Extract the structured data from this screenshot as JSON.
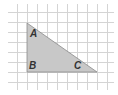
{
  "diagram": {
    "type": "right-triangle-on-grid",
    "grid": {
      "spacing": 10,
      "vertical_lines_x": [
        17,
        27,
        37,
        47,
        57,
        67,
        77,
        87,
        97,
        107
      ],
      "horizontal_lines_y": [
        12,
        22,
        32,
        42,
        52,
        62,
        72,
        82
      ],
      "color": "#d4d4d4"
    },
    "triangle": {
      "fill": "#c8c8c8",
      "stroke": "#8a8a8a",
      "vertices": {
        "A": {
          "x": 27,
          "y": 23
        },
        "B": {
          "x": 27,
          "y": 72
        },
        "C": {
          "x": 97,
          "y": 72
        }
      },
      "right_angle_at": "B"
    },
    "labels": {
      "A": "A",
      "B": "B",
      "C": "C"
    }
  }
}
